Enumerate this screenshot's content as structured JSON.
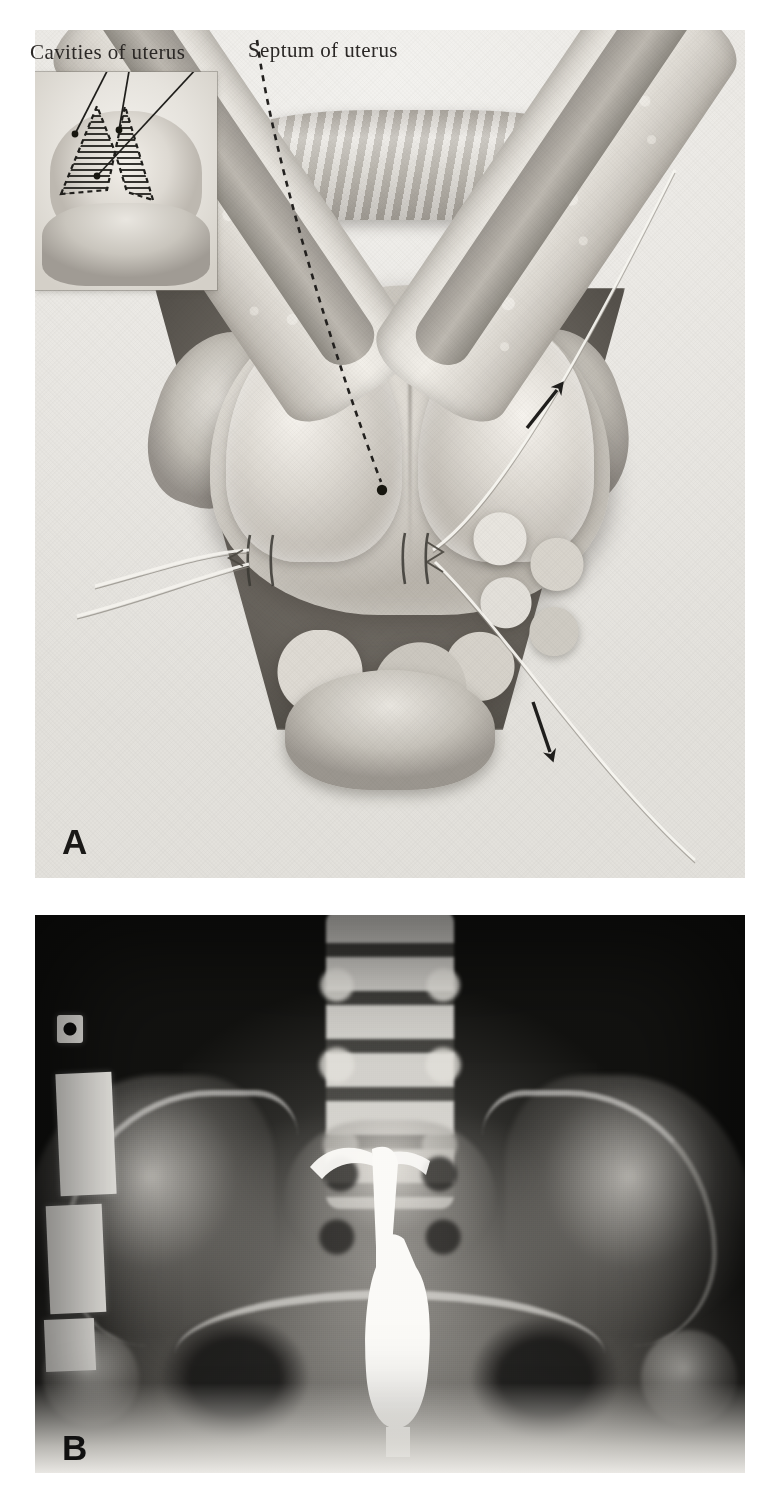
{
  "figure": {
    "type": "medical-figure-plate",
    "panels": [
      {
        "letter": "A",
        "kind": "surgical-illustration",
        "description": "Metroplasty of septate uterus seen through an abdominal incision, with stay sutures placed on the uterine fundus and an inset showing the hatched uterine cavities separated by the septum.",
        "labels": [
          {
            "id": "cavities",
            "text": "Cavities of uterus"
          },
          {
            "id": "septum",
            "text": "Septum of uterus"
          }
        ],
        "annotations": [
          {
            "id": "arrow-upper",
            "kind": "arrow",
            "direction": "up-right"
          },
          {
            "id": "arrow-lower",
            "kind": "arrow",
            "direction": "down"
          },
          {
            "id": "leader-septum",
            "kind": "dashed-leader-line"
          },
          {
            "id": "leader-cavities-left",
            "kind": "solid-leader-line"
          },
          {
            "id": "leader-cavities-right",
            "kind": "solid-leader-line"
          }
        ],
        "inset": {
          "id": "uterine-cavity-inset",
          "description": "Hatched V-shaped outline of the two uterine cavities with the intervening septum",
          "hatch_fill": "horizontal-line-hatching",
          "outline_style": "dashed"
        }
      },
      {
        "letter": "B",
        "kind": "radiograph",
        "description": "Anteroposterior pelvic hysterosalpingogram showing lumbar spine, sacrum, iliac wings and a contrast-filled uterine cavity with cannula.",
        "markers": [
          {
            "id": "marker-top",
            "text": ""
          },
          {
            "id": "marker-plate-1",
            "text": ""
          },
          {
            "id": "marker-plate-2",
            "text": ""
          },
          {
            "id": "marker-plate-3",
            "text": ""
          }
        ]
      }
    ]
  },
  "colors": {
    "page_background": "#ffffff",
    "illustration_paper": "#edebe6",
    "ink": "#2b2826",
    "radiograph_dark": "#111110",
    "radiograph_bone": "#e8e6e0",
    "marker_plate": "#f0eee9"
  }
}
